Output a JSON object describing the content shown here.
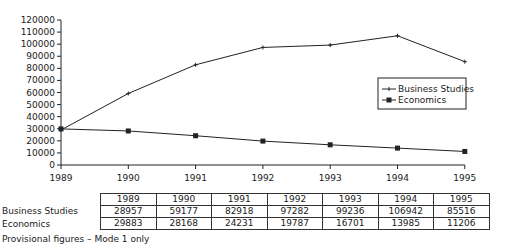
{
  "chart_data": {
    "type": "line",
    "title": "",
    "xlabel": "",
    "ylabel": "",
    "categories": [
      "1989",
      "1990",
      "1991",
      "1992",
      "1993",
      "1994",
      "1995"
    ],
    "series": [
      {
        "name": "Business Studies",
        "marker": "plus",
        "values": [
          28957,
          59177,
          82918,
          97282,
          99236,
          106942,
          85516
        ]
      },
      {
        "name": "Economics",
        "marker": "square",
        "values": [
          29883,
          28168,
          24231,
          19787,
          16701,
          13985,
          11206
        ]
      }
    ],
    "ylim": [
      0,
      120000
    ],
    "yticks": [
      0,
      10000,
      20000,
      30000,
      40000,
      50000,
      60000,
      70000,
      80000,
      90000,
      100000,
      110000,
      120000
    ],
    "grid": false,
    "legend_position": "right-middle"
  },
  "table": {
    "headers": [
      "1989",
      "1990",
      "1991",
      "1992",
      "1993",
      "1994",
      "1995"
    ],
    "rows": [
      {
        "label": "Business Studies",
        "cells": [
          "28957",
          "59177",
          "82918",
          "97282",
          "99236",
          "106942",
          "85516"
        ]
      },
      {
        "label": "Economics",
        "cells": [
          "29883",
          "28168",
          "24231",
          "19787",
          "16701",
          "13985",
          "11206"
        ]
      }
    ]
  },
  "note": "Provisional figures – Mode 1 only",
  "colors": {
    "line": "#222222",
    "text": "#1a1a1a",
    "background": "#ffffff"
  }
}
